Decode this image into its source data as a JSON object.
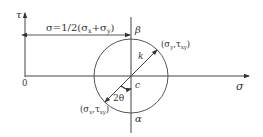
{
  "diagram": {
    "type": "Mohr circle",
    "axes": {
      "horizontal_label": "σ",
      "vertical_label": "τ",
      "origin_label": "0"
    },
    "center_annotation": "σ=1/2(σx+σy)",
    "center_annotation_parts": {
      "prefix": "σ=1/2(σ",
      "sub1": "x",
      "mid": "+σ",
      "sub2": "y",
      "suffix": ")"
    },
    "center_label": "c",
    "radius_label": "k",
    "angle_label": "2θ",
    "vertical_line_top_label": "β",
    "vertical_line_bottom_label": "α",
    "point_upper": {
      "text": "(σy,τxy)",
      "parts": {
        "a": "(σ",
        "a_sub": "y",
        "b": ",τ",
        "b_sub": "xy",
        "c": ")"
      }
    },
    "point_lower": {
      "text": "(σx,τxy)",
      "parts": {
        "a": "(σ",
        "a_sub": "x",
        "b": ",τ",
        "b_sub": "xy",
        "c": ")"
      }
    },
    "colors": {
      "line": "#444444",
      "text": "#333333",
      "background": "#ffffff"
    }
  }
}
